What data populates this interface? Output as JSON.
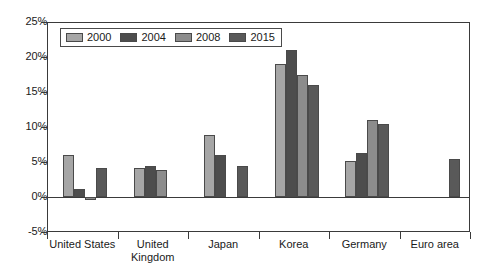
{
  "chart_data": {
    "type": "bar",
    "title": "",
    "subtitle": "",
    "xlabel": "",
    "ylabel": "",
    "ylim": [
      -5,
      25
    ],
    "ytick_labels": [
      "25%",
      "20%",
      "15%",
      "10%",
      "5%",
      "0%",
      "-5%"
    ],
    "ytick_values": [
      25,
      20,
      15,
      10,
      5,
      0,
      -5
    ],
    "grid": false,
    "legend_position": "top-left-inside",
    "categories": [
      "United States",
      "United Kingdom",
      "Japan",
      "Korea",
      "Germany",
      "Euro area"
    ],
    "series": [
      {
        "name": "2000",
        "color": "#a6a6a6",
        "values": [
          6.0,
          4.2,
          8.8,
          19.0,
          5.2,
          null
        ]
      },
      {
        "name": "2004",
        "color": "#4d4d4d",
        "values": [
          1.2,
          4.5,
          6.0,
          21.0,
          6.3,
          null
        ]
      },
      {
        "name": "2008",
        "color": "#8c8c8c",
        "values": [
          -0.4,
          3.8,
          null,
          17.5,
          11.0,
          null
        ]
      },
      {
        "name": "2015",
        "color": "#595959",
        "values": [
          4.2,
          null,
          4.5,
          16.0,
          10.4,
          5.5
        ]
      }
    ]
  },
  "legend": {
    "items": [
      {
        "label": "2000",
        "color": "#a6a6a6"
      },
      {
        "label": "2004",
        "color": "#4d4d4d"
      },
      {
        "label": "2008",
        "color": "#8c8c8c"
      },
      {
        "label": "2015",
        "color": "#595959"
      }
    ]
  },
  "axis": {
    "line_color": "#3a3a3a"
  }
}
